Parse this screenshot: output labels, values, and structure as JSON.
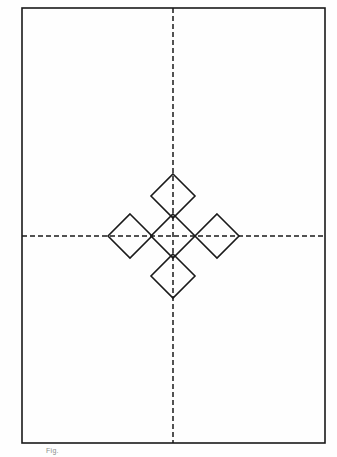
{
  "figure": {
    "background_color": "#fefefe",
    "frame": {
      "name": "page border rectangle",
      "x": 22,
      "y": 8,
      "width": 303,
      "height": 435,
      "stroke_color": "#1a1a1a",
      "stroke_width": 1.6,
      "fill": "none"
    },
    "axes": {
      "stroke_color": "#1a1a1a",
      "stroke_width": 1.5,
      "dash_pattern": "5 3",
      "vertical": {
        "name": "vertical centre line",
        "x": 173,
        "y1": 8,
        "y2": 443
      },
      "horizontal": {
        "name": "horizontal centre line",
        "y": 236,
        "x1": 22,
        "x2": 325
      },
      "intersection": {
        "x": 173,
        "y": 236
      }
    },
    "squares": {
      "stroke_color": "#1a1a1a",
      "stroke_width": 1.6,
      "fill": "none",
      "rotation_degrees": 45,
      "half_diagonal": 22,
      "side_length": 31.1,
      "count": 5,
      "items": [
        {
          "name": "centre-square",
          "position": "centre",
          "cx": 173,
          "cy": 236
        },
        {
          "name": "top-square",
          "position": "top",
          "cx": 173,
          "cy": 196
        },
        {
          "name": "left-square",
          "position": "left",
          "cx": 130,
          "cy": 236
        },
        {
          "name": "right-square",
          "position": "right",
          "cx": 217,
          "cy": 236
        },
        {
          "name": "bottom-square",
          "position": "bottom",
          "cx": 173,
          "cy": 276
        }
      ]
    },
    "caption": {
      "text": "Fig.",
      "color": "#8d8d8d"
    }
  }
}
